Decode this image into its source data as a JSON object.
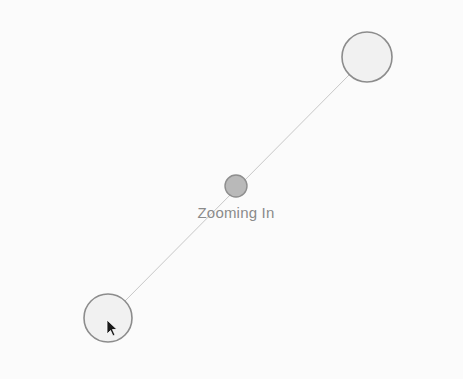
{
  "gesture": {
    "label": "Zooming In",
    "type": "pinch-zoom-in"
  },
  "points": {
    "start_touch": {
      "cx": 108,
      "cy": 318,
      "r": 24
    },
    "end_touch": {
      "cx": 367,
      "cy": 57,
      "r": 25
    },
    "center": {
      "cx": 236,
      "cy": 186,
      "r": 11
    }
  },
  "cursor": {
    "x": 107,
    "y": 320
  },
  "colors": {
    "background": "#fbfbfb",
    "ring": "#8c8c8c",
    "fill": "#f0f0f0",
    "center_fill": "#b8b8b8",
    "line": "#c4c4c4",
    "label": "#8a8a8a"
  }
}
